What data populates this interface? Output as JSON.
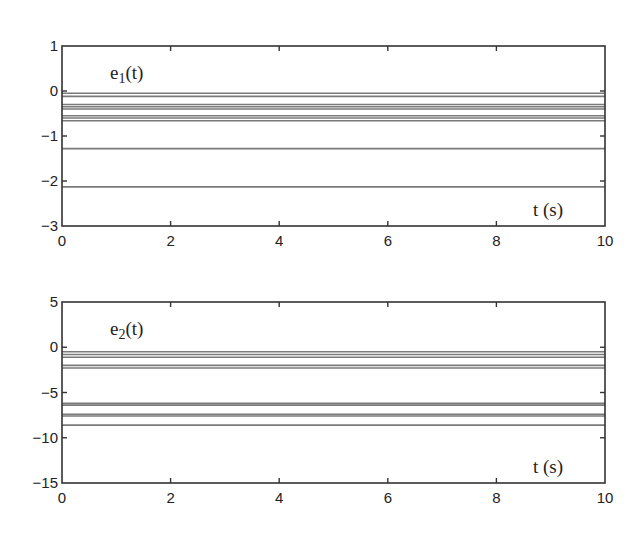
{
  "chart_data": [
    {
      "type": "line",
      "title": "",
      "annotation": "e1(t)",
      "annotation_parts": {
        "base": "e",
        "sub": "1",
        "arg": "(t)"
      },
      "xlabel": "t (s)",
      "xlabel_parts": {
        "var": "t",
        "unit": " (s)"
      },
      "ylabel": "",
      "xlim": [
        0,
        10
      ],
      "ylim": [
        -3,
        1
      ],
      "xticks": [
        "0",
        "2",
        "4",
        "6",
        "8",
        "10"
      ],
      "yticks": [
        "1",
        "0",
        "−1",
        "−2",
        "−3"
      ],
      "grid": false,
      "legend": null,
      "x": [
        0,
        10
      ],
      "series": [
        {
          "name": "e1_1",
          "values": [
            -0.05,
            -0.05
          ]
        },
        {
          "name": "e1_2",
          "values": [
            -0.12,
            -0.12
          ]
        },
        {
          "name": "e1_3",
          "values": [
            -0.3,
            -0.3
          ]
        },
        {
          "name": "e1_4",
          "values": [
            -0.35,
            -0.35
          ]
        },
        {
          "name": "e1_5",
          "values": [
            -0.4,
            -0.4
          ]
        },
        {
          "name": "e1_6",
          "values": [
            -0.55,
            -0.55
          ]
        },
        {
          "name": "e1_7",
          "values": [
            -0.6,
            -0.6
          ]
        },
        {
          "name": "e1_8",
          "values": [
            -0.66,
            -0.66
          ]
        },
        {
          "name": "e1_9",
          "values": [
            -1.28,
            -1.28
          ]
        },
        {
          "name": "e1_10",
          "values": [
            -2.13,
            -2.13
          ]
        }
      ],
      "line_color": "#7a7a7a"
    },
    {
      "type": "line",
      "title": "",
      "annotation": "e2(t)",
      "annotation_parts": {
        "base": "e",
        "sub": "2",
        "arg": "(t)"
      },
      "xlabel": "t (s)",
      "xlabel_parts": {
        "var": "t",
        "unit": " (s)"
      },
      "ylabel": "",
      "xlim": [
        0,
        10
      ],
      "ylim": [
        -15,
        5
      ],
      "xticks": [
        "0",
        "2",
        "4",
        "6",
        "8",
        "10"
      ],
      "yticks": [
        "5",
        "0",
        "−5",
        "−10",
        "−15"
      ],
      "grid": false,
      "legend": null,
      "x": [
        0,
        10
      ],
      "series": [
        {
          "name": "e2_1",
          "values": [
            -0.5,
            -0.5
          ]
        },
        {
          "name": "e2_2",
          "values": [
            -0.8,
            -0.8
          ]
        },
        {
          "name": "e2_3",
          "values": [
            -1.1,
            -1.1
          ]
        },
        {
          "name": "e2_4",
          "values": [
            -2.0,
            -2.0
          ]
        },
        {
          "name": "e2_5",
          "values": [
            -2.3,
            -2.3
          ]
        },
        {
          "name": "e2_6",
          "values": [
            -6.2,
            -6.2
          ]
        },
        {
          "name": "e2_7",
          "values": [
            -6.4,
            -6.4
          ]
        },
        {
          "name": "e2_8",
          "values": [
            -7.4,
            -7.4
          ]
        },
        {
          "name": "e2_9",
          "values": [
            -7.6,
            -7.6
          ]
        },
        {
          "name": "e2_10",
          "values": [
            -8.6,
            -8.6
          ]
        }
      ],
      "line_color": "#7a7a7a"
    }
  ],
  "layout": {
    "panels": [
      {
        "left": 62,
        "right": 605,
        "top": 46,
        "bottom": 226
      },
      {
        "left": 62,
        "right": 605,
        "top": 302,
        "bottom": 483
      }
    ]
  }
}
